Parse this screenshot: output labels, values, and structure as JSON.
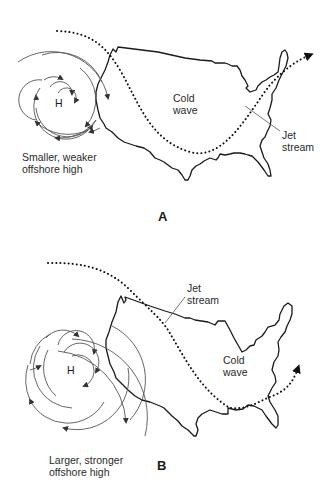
{
  "panels": [
    {
      "id": "A",
      "letter": "A",
      "high_label": "H",
      "high_caption_line1": "Smaller, weaker",
      "high_caption_line2": "offshore high",
      "cold_wave_line1": "Cold",
      "cold_wave_line2": "wave",
      "jet_stream_line1": "Jet",
      "jet_stream_line2": "stream"
    },
    {
      "id": "B",
      "letter": "B",
      "high_label": "H",
      "high_caption_line1": "Larger, stronger",
      "high_caption_line2": "offshore high",
      "cold_wave_line1": "Cold",
      "cold_wave_line2": "wave",
      "jet_stream_line1": "Jet",
      "jet_stream_line2": "stream"
    }
  ],
  "colors": {
    "outline": "#1a1a1a",
    "circulation": "#555555",
    "jet_stream": "#111111",
    "background": "#ffffff"
  }
}
